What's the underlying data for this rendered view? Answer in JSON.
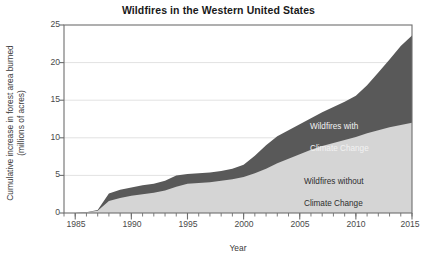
{
  "chart_data": {
    "type": "area",
    "title": "Wildfires in the Western United States",
    "xlabel": "Year",
    "ylabel": "Cumulative increase in forest area burned\n(millions of acres)",
    "ylabel_line1": "Cumulative increase in forest area burned",
    "ylabel_line2": "(millions of acres)",
    "xlim": [
      1984,
      2015
    ],
    "ylim": [
      0,
      25
    ],
    "yticks": [
      0,
      5,
      10,
      15,
      20,
      25
    ],
    "xticks": [
      1985,
      1990,
      1995,
      2000,
      2005,
      2010,
      2015
    ],
    "xminor_tick_interval": 1,
    "grid": "horizontal",
    "legend_position": "inline-annotations",
    "stacked": true,
    "x": [
      1984,
      1985,
      1986,
      1987,
      1988,
      1989,
      1990,
      1991,
      1992,
      1993,
      1994,
      1995,
      1996,
      1997,
      1998,
      1999,
      2000,
      2001,
      2002,
      2003,
      2004,
      2005,
      2006,
      2007,
      2008,
      2009,
      2010,
      2011,
      2012,
      2013,
      2014,
      2015
    ],
    "series": [
      {
        "name": "Wildfires without Climate Change",
        "color": "#d5d5d5",
        "values": [
          0,
          0,
          0.1,
          0.3,
          1.6,
          2.0,
          2.3,
          2.5,
          2.7,
          3.0,
          3.5,
          3.9,
          4.0,
          4.1,
          4.3,
          4.5,
          4.8,
          5.3,
          5.9,
          6.6,
          7.2,
          7.8,
          8.4,
          8.9,
          9.3,
          9.7,
          10.1,
          10.6,
          11.0,
          11.4,
          11.7,
          12.0
        ]
      },
      {
        "name": "Wildfires with Climate Change",
        "color": "#595959",
        "values": [
          0,
          0,
          0.1,
          0.4,
          2.6,
          3.1,
          3.4,
          3.7,
          3.9,
          4.3,
          5.0,
          5.2,
          5.3,
          5.4,
          5.6,
          5.9,
          6.4,
          7.6,
          9.0,
          10.2,
          11.0,
          11.8,
          12.6,
          13.4,
          14.1,
          14.8,
          15.6,
          17.0,
          18.7,
          20.4,
          22.2,
          23.6
        ]
      }
    ],
    "annotations": [
      {
        "text": "Wildfires with\nClimate Change",
        "line1": "Wildfires with",
        "line2": "Climate Change",
        "x": 2008,
        "y": 14.2,
        "band": "with-climate-change"
      },
      {
        "text": "Wildfires without\nClimate Change",
        "line1": "Wildfires without",
        "line2": "Climate Change",
        "x": 2007,
        "y": 6.2,
        "band": "without-climate-change"
      }
    ]
  },
  "axis_colors": {
    "frame": "#6e6e6e",
    "grid": "#e2e2e2",
    "tick_text": "#4a4a4a",
    "title_text": "#1a1a1a"
  }
}
